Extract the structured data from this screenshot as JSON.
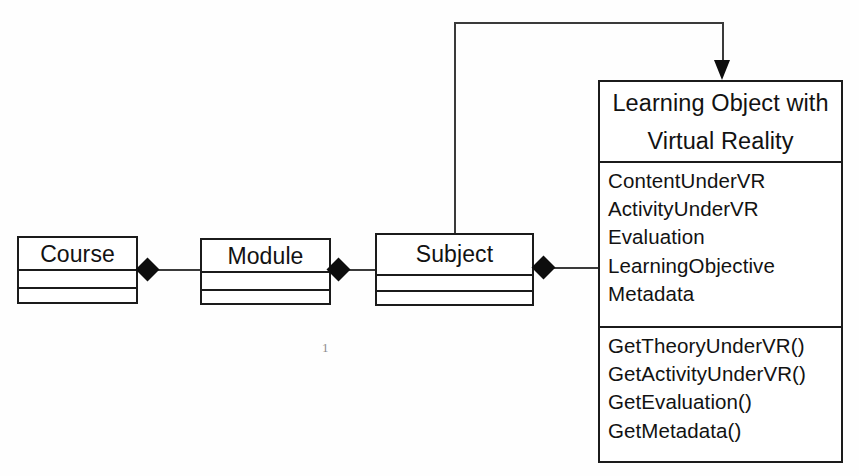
{
  "diagram": {
    "classes": [
      {
        "id": "course",
        "name": "Course",
        "attributes": [],
        "operations": []
      },
      {
        "id": "module",
        "name": "Module",
        "attributes": [],
        "operations": []
      },
      {
        "id": "subject",
        "name": "Subject",
        "attributes": [],
        "operations": []
      },
      {
        "id": "learning-object-vr",
        "name_line1": "Learning Object with",
        "name_line2": "Virtual Reality",
        "attributes": [
          "ContentUnderVR",
          "ActivityUnderVR",
          "Evaluation",
          "LearningObjective",
          "Metadata"
        ],
        "operations": [
          "GetTheoryUnderVR()",
          "GetActivityUnderVR()",
          "GetEvaluation()",
          "GetMetadata()"
        ]
      }
    ],
    "relationships": [
      {
        "id": "course-module",
        "type": "composition",
        "from": "Course",
        "to": "Module",
        "marker": "filled-diamond"
      },
      {
        "id": "module-subject",
        "type": "composition",
        "from": "Module",
        "to": "Subject",
        "marker": "filled-diamond"
      },
      {
        "id": "subject-learning-object-vr",
        "type": "composition",
        "from": "Subject",
        "to": "Learning Object with Virtual Reality",
        "marker": "filled-diamond"
      },
      {
        "id": "subject-to-vr-association",
        "type": "directed-association",
        "from": "Subject",
        "to": "Learning Object with Virtual Reality",
        "marker": "filled-arrowhead"
      }
    ],
    "multiplicity_labels": [
      {
        "id": "mult-1",
        "value": "1"
      }
    ],
    "colors": {
      "background": "#fefefe",
      "stroke": "#1b1b1b",
      "line": "#3a3a3a",
      "text": "#121212",
      "marker": "#0d0d0d",
      "multiplicity_text": "#8d8d8d"
    }
  }
}
